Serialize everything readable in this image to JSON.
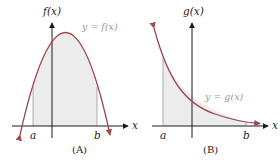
{
  "panels": [
    {
      "id": "A",
      "caption": "(A)",
      "y_axis_label": "f(x)",
      "x_axis_label": "x",
      "curve_label": "y = f(x)",
      "bound_left": "a",
      "bound_right": "b",
      "curve_shape": "downward parabola"
    },
    {
      "id": "B",
      "caption": "(B)",
      "y_axis_label": "g(x)",
      "x_axis_label": "x",
      "curve_label": "y = g(x)",
      "bound_left": "a",
      "bound_right": "b",
      "curve_shape": "decaying exponential"
    }
  ],
  "colors": {
    "curve": "#a0484f",
    "shade": "#ececec",
    "axis": "#1a1a1a",
    "curve_label": "#9a9a9a"
  }
}
